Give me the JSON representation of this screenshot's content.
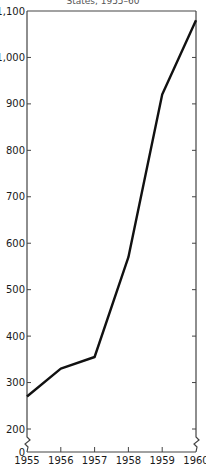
{
  "chart_data": {
    "type": "line",
    "title": "States, 1955–60",
    "xlabel": "",
    "ylabel": "",
    "x": [
      1955,
      1956,
      1957,
      1958,
      1959,
      1960
    ],
    "series": [
      {
        "name": "value",
        "values": [
          270,
          330,
          355,
          570,
          920,
          1080
        ]
      }
    ],
    "xticks": [
      "1955",
      "1956",
      "1957",
      "1958",
      "1959",
      "1960"
    ],
    "yticks": [
      {
        "value": 0,
        "label": "0"
      },
      {
        "value": 200,
        "label": "200"
      },
      {
        "value": 300,
        "label": "300"
      },
      {
        "value": 400,
        "label": "400"
      },
      {
        "value": 500,
        "label": "500"
      },
      {
        "value": 600,
        "label": "600"
      },
      {
        "value": 700,
        "label": "700"
      },
      {
        "value": 800,
        "label": "800"
      },
      {
        "value": 900,
        "label": "900"
      },
      {
        "value": 1000,
        "label": "1,000"
      },
      {
        "value": 1100,
        "label": "1,100"
      }
    ],
    "ylim": [
      0,
      1100
    ],
    "xlim": [
      1955,
      1960
    ],
    "axis_break": "between 0 and 200",
    "grid": false,
    "legend": "none"
  }
}
